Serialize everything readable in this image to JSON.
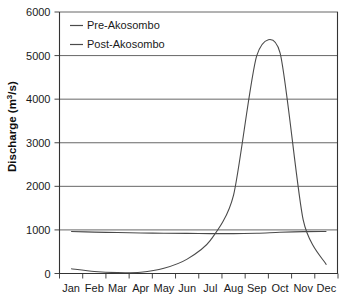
{
  "chart_data": {
    "type": "line",
    "title": "",
    "xlabel": "",
    "ylabel": "Discharge (m3/s)",
    "ylabel_prefix": "Discharge (m",
    "ylabel_sup": "3",
    "ylabel_suffix": "/s)",
    "categories": [
      "Jan",
      "Feb",
      "Mar",
      "Apr",
      "May",
      "Jun",
      "Jul",
      "Aug",
      "Sep",
      "Oct",
      "Nov",
      "Dec"
    ],
    "ylim": [
      0,
      6000
    ],
    "yticks": [
      0,
      1000,
      2000,
      3000,
      4000,
      5000,
      6000
    ],
    "ytick_labels": [
      "0",
      "1000",
      "2000",
      "3000",
      "4000",
      "5000",
      "6000"
    ],
    "grid": true,
    "legend_position": "top-left",
    "series": [
      {
        "name": "Pre-Akosombo",
        "color": "#4a4a4a",
        "values": [
          110,
          45,
          20,
          30,
          120,
          330,
          760,
          1800,
          5000,
          5070,
          1230,
          200
        ]
      },
      {
        "name": "Post-Akosombo",
        "color": "#4a4a4a",
        "values": [
          965,
          950,
          940,
          930,
          925,
          920,
          915,
          915,
          925,
          945,
          960,
          965
        ]
      }
    ]
  },
  "legend": {
    "items": [
      {
        "label": "Pre-Akosombo"
      },
      {
        "label": "Post-Akosombo"
      }
    ]
  }
}
